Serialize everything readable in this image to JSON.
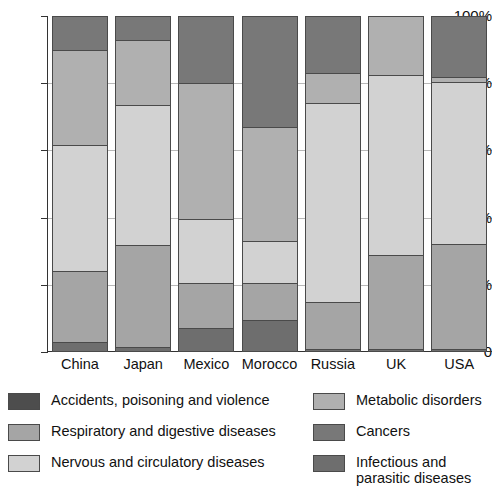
{
  "chart_data": {
    "type": "bar",
    "subtype": "stacked-percentage",
    "title": "",
    "xlabel": "",
    "ylabel": "",
    "ylim": [
      0,
      100
    ],
    "ytick_labels": [
      "0",
      "20%",
      "40%",
      "60%",
      "80%",
      "100%"
    ],
    "ytick_values": [
      0,
      20,
      40,
      60,
      80,
      100
    ],
    "grid": true,
    "grid_axis": "y",
    "legend_position": "bottom",
    "categories": [
      "China",
      "Japan",
      "Mexico",
      "Morocco",
      "Russia",
      "UK",
      "USA"
    ],
    "series": [
      {
        "name": "Infectious and parasitic diseases",
        "color": "#6e6e6e",
        "values": [
          3,
          1.5,
          7,
          9.5,
          0.8,
          0.8,
          0.8
        ]
      },
      {
        "name": "Respiratory and digestive diseases",
        "color": "#a5a5a5",
        "values": [
          21,
          30.5,
          13.5,
          11,
          14.2,
          28.2,
          31.2
        ]
      },
      {
        "name": "Nervous and circulatory diseases",
        "color": "#d2d2d2",
        "values": [
          37.5,
          41.5,
          19,
          12.5,
          59,
          53.5,
          48.5
        ]
      },
      {
        "name": "Metabolic disorders",
        "color": "#b0b0b0",
        "values": [
          28.5,
          19.5,
          40.5,
          34,
          9,
          17.5,
          1.5
        ]
      },
      {
        "name": "Cancers",
        "color": "#787878",
        "values": [
          10,
          7,
          20,
          33,
          17,
          0,
          18
        ]
      },
      {
        "name": "Accidents, poisoning and violence",
        "color": "#4d4d4d",
        "values": [
          0,
          0,
          0,
          0,
          0,
          0,
          0
        ]
      }
    ]
  },
  "legend": {
    "left_items": [
      {
        "label": "Accidents, poisoning and violence",
        "color": "#4d4d4d",
        "swatch_name": "legend-swatch-accidents"
      },
      {
        "label": "Respiratory and digestive diseases",
        "color": "#a5a5a5",
        "swatch_name": "legend-swatch-respiratory"
      },
      {
        "label": "Nervous and circulatory diseases",
        "color": "#d2d2d2",
        "swatch_name": "legend-swatch-nervous"
      }
    ],
    "right_items": [
      {
        "label": "Metabolic disorders",
        "color": "#b0b0b0",
        "swatch_name": "legend-swatch-metabolic"
      },
      {
        "label": "Cancers",
        "color": "#787878",
        "swatch_name": "legend-swatch-cancers"
      },
      {
        "label": "Infectious and\nparasitic diseases",
        "color": "#6e6e6e",
        "swatch_name": "legend-swatch-infectious"
      }
    ]
  }
}
